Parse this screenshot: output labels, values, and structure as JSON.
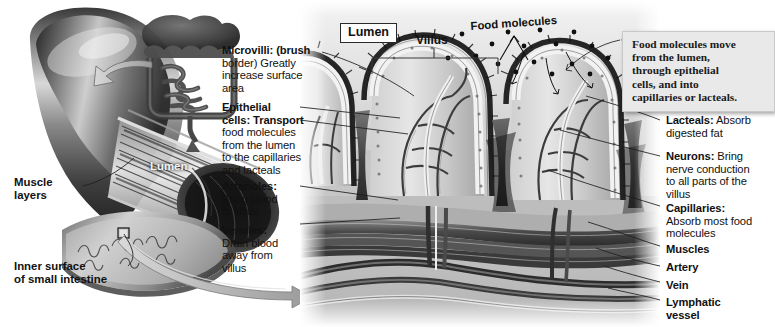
{
  "figure": {
    "background_color": "#ffffff",
    "ink_color": "#1d1d1d",
    "callout_box_color": "#e9e9e9"
  },
  "left_illustration": {
    "name": "small-intestine-cutaway",
    "labels": {
      "lumen": "Lumen",
      "muscle_layers": "Muscle\nlayers",
      "muscle_layers_line1": "Muscle",
      "muscle_layers_line2": "layers",
      "inner_surface_line1": "Inner surface",
      "inner_surface_line2": "of small intestine"
    },
    "inset": {
      "name": "digestive-system-inset",
      "description": "whole digestive tract inset with arrow to intestine segment"
    }
  },
  "main_panel": {
    "name": "villus-cross-section",
    "top_labels": {
      "lumen": "Lumen",
      "villus": "Villus",
      "food_molecules": "Food molecules"
    }
  },
  "left_labels": [
    {
      "id": "microvilli",
      "term": "Microvilli:",
      "desc": " (brush border) Greatly increase surface area",
      "lines": [
        "Microvilli: (brush",
        "border) Greatly",
        "increase surface",
        "area"
      ]
    },
    {
      "id": "epithelial-cells",
      "term": "Epithelial cells:",
      "desc": " Transport food molecules from the lumen to the capillaries and lacteals",
      "lines": [
        "Epithelial",
        "cells: Transport",
        "food molecules",
        "from the lumen",
        "to the capillaries",
        "and lacteals"
      ]
    },
    {
      "id": "arterioles",
      "term": "Arterioles:",
      "desc": " Bring blood to villus",
      "lines": [
        "Arterioles:",
        "Bring blood",
        "to villus"
      ]
    },
    {
      "id": "venules",
      "term": "Venules:",
      "desc": " Drain blood away from villus",
      "lines": [
        "Venules:",
        "Drain blood",
        "away from",
        "villus"
      ]
    }
  ],
  "right_labels": [
    {
      "id": "lacteals",
      "term": "Lacteals:",
      "desc": " Absorb digested fat",
      "lines": [
        "Lacteals: Absorb",
        "digested fat"
      ]
    },
    {
      "id": "neurons",
      "term": "Neurons:",
      "desc": " Bring nerve conduction to all parts of the villus",
      "lines": [
        "Neurons: Bring",
        "nerve conduction",
        "to all parts of the",
        "villus"
      ]
    },
    {
      "id": "capillaries",
      "term": "Capillaries:",
      "desc": " Absorb most food molecules",
      "lines": [
        "Capillaries:",
        "Absorb most food",
        "molecules"
      ]
    },
    {
      "id": "muscles",
      "term": "Muscles",
      "desc": "",
      "lines": [
        "Muscles"
      ]
    },
    {
      "id": "artery",
      "term": "Artery",
      "desc": "",
      "lines": [
        "Artery"
      ]
    },
    {
      "id": "vein",
      "term": "Vein",
      "desc": "",
      "lines": [
        "Vein"
      ]
    },
    {
      "id": "lymphatic-vessel",
      "term": "Lymphatic vessel",
      "desc": "",
      "lines": [
        "Lymphatic",
        "vessel"
      ]
    }
  ],
  "callout": {
    "id": "food-molecule-pathway",
    "text": "Food molecules move from the lumen, through epithelial cells, and into capillaries or lacteals.",
    "lines": [
      "Food molecules move",
      "from the lumen,",
      "through epithelial",
      "cells, and into",
      "capillaries or lacteals."
    ]
  }
}
